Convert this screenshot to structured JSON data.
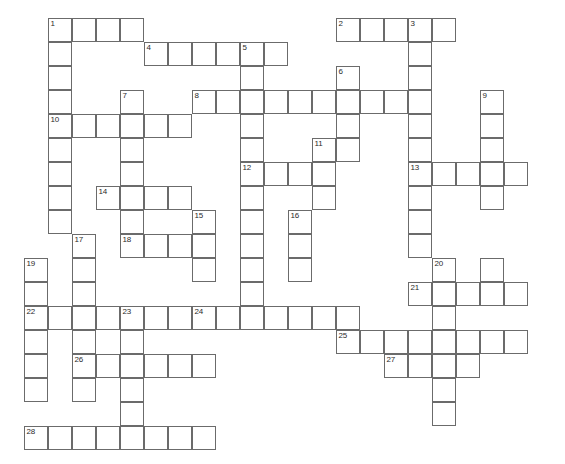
{
  "puzzle": {
    "title": "Crossword Grid",
    "geometry": {
      "origin_x": 24,
      "origin_y": 18,
      "cell_size": 24,
      "columns": 22,
      "rows": 18,
      "border_color": "#6b6b6b",
      "cell_fill": "#ffffff",
      "number_color": "#2b2b2b",
      "background": "#ffffff"
    },
    "entries": [
      {
        "number": 1,
        "direction": "across",
        "col": 1,
        "row": 0,
        "length": 4
      },
      {
        "number": 1,
        "direction": "down",
        "col": 1,
        "row": 0,
        "length": 9
      },
      {
        "number": 2,
        "direction": "across",
        "col": 13,
        "row": 0,
        "length": 5
      },
      {
        "number": 3,
        "direction": "down",
        "col": 16,
        "row": 0,
        "length": 9
      },
      {
        "number": 4,
        "direction": "across",
        "col": 5,
        "row": 1,
        "length": 6
      },
      {
        "number": 5,
        "direction": "down",
        "col": 9,
        "row": 1,
        "length": 9
      },
      {
        "number": 6,
        "direction": "down",
        "col": 13,
        "row": 2,
        "length": 4
      },
      {
        "number": 7,
        "direction": "down",
        "col": 4,
        "row": 3,
        "length": 7
      },
      {
        "number": 8,
        "direction": "across",
        "col": 7,
        "row": 3,
        "length": 10
      },
      {
        "number": 9,
        "direction": "down",
        "col": 19,
        "row": 3,
        "length": 5
      },
      {
        "number": 10,
        "direction": "across",
        "col": 1,
        "row": 4,
        "length": 6
      },
      {
        "number": 11,
        "direction": "down",
        "col": 12,
        "row": 5,
        "length": 3
      },
      {
        "number": 12,
        "direction": "across",
        "col": 9,
        "row": 6,
        "length": 4
      },
      {
        "number": 13,
        "direction": "across",
        "col": 16,
        "row": 6,
        "length": 5
      },
      {
        "number": 14,
        "direction": "across",
        "col": 3,
        "row": 7,
        "length": 4
      },
      {
        "number": 15,
        "direction": "down",
        "col": 7,
        "row": 8,
        "length": 3
      },
      {
        "number": 16,
        "direction": "down",
        "col": 11,
        "row": 8,
        "length": 3
      },
      {
        "number": 17,
        "direction": "down",
        "col": 2,
        "row": 9,
        "length": 9
      },
      {
        "number": 18,
        "direction": "across",
        "col": 4,
        "row": 9,
        "length": 3
      },
      {
        "number": 19,
        "direction": "down",
        "col": 0,
        "row": 10,
        "length": 8
      },
      {
        "number": 20,
        "direction": "down",
        "col": 17,
        "row": 10,
        "length": 3
      },
      {
        "number": 21,
        "direction": "across",
        "col": 16,
        "row": 11,
        "length": 5
      },
      {
        "number": 22,
        "direction": "across",
        "col": 0,
        "row": 12,
        "length": 7
      },
      {
        "number": 23,
        "direction": "down",
        "col": 4,
        "row": 12,
        "length": 7
      },
      {
        "number": 24,
        "direction": "across",
        "col": 7,
        "row": 12,
        "length": 7
      },
      {
        "number": 25,
        "direction": "across",
        "col": 13,
        "row": 13,
        "length": 8
      },
      {
        "number": 26,
        "direction": "across",
        "col": 2,
        "row": 14,
        "length": 6
      },
      {
        "number": 27,
        "direction": "across",
        "col": 15,
        "row": 14,
        "length": 4
      },
      {
        "number": 28,
        "direction": "across",
        "col": 0,
        "row": 17,
        "length": 8
      }
    ],
    "cells": [
      {
        "col": 1,
        "row": 0,
        "number": 1
      },
      {
        "col": 2,
        "row": 0
      },
      {
        "col": 3,
        "row": 0
      },
      {
        "col": 4,
        "row": 0
      },
      {
        "col": 13,
        "row": 0,
        "number": 2
      },
      {
        "col": 14,
        "row": 0
      },
      {
        "col": 15,
        "row": 0
      },
      {
        "col": 16,
        "row": 0,
        "number": 3
      },
      {
        "col": 17,
        "row": 0
      },
      {
        "col": 1,
        "row": 1
      },
      {
        "col": 5,
        "row": 1,
        "number": 4
      },
      {
        "col": 6,
        "row": 1
      },
      {
        "col": 7,
        "row": 1
      },
      {
        "col": 8,
        "row": 1
      },
      {
        "col": 9,
        "row": 1,
        "number": 5
      },
      {
        "col": 10,
        "row": 1
      },
      {
        "col": 16,
        "row": 1
      },
      {
        "col": 1,
        "row": 2
      },
      {
        "col": 9,
        "row": 2
      },
      {
        "col": 13,
        "row": 2,
        "number": 6
      },
      {
        "col": 16,
        "row": 2
      },
      {
        "col": 1,
        "row": 3
      },
      {
        "col": 4,
        "row": 3,
        "number": 7
      },
      {
        "col": 7,
        "row": 3,
        "number": 8
      },
      {
        "col": 8,
        "row": 3
      },
      {
        "col": 9,
        "row": 3
      },
      {
        "col": 10,
        "row": 3
      },
      {
        "col": 11,
        "row": 3
      },
      {
        "col": 12,
        "row": 3
      },
      {
        "col": 13,
        "row": 3
      },
      {
        "col": 14,
        "row": 3
      },
      {
        "col": 15,
        "row": 3
      },
      {
        "col": 16,
        "row": 3
      },
      {
        "col": 19,
        "row": 3,
        "number": 9
      },
      {
        "col": 1,
        "row": 4,
        "number": 10
      },
      {
        "col": 2,
        "row": 4
      },
      {
        "col": 3,
        "row": 4
      },
      {
        "col": 4,
        "row": 4
      },
      {
        "col": 5,
        "row": 4
      },
      {
        "col": 6,
        "row": 4
      },
      {
        "col": 9,
        "row": 4
      },
      {
        "col": 13,
        "row": 4
      },
      {
        "col": 16,
        "row": 4
      },
      {
        "col": 19,
        "row": 4
      },
      {
        "col": 1,
        "row": 5
      },
      {
        "col": 4,
        "row": 5
      },
      {
        "col": 9,
        "row": 5
      },
      {
        "col": 12,
        "row": 5,
        "number": 11
      },
      {
        "col": 13,
        "row": 5
      },
      {
        "col": 16,
        "row": 5
      },
      {
        "col": 19,
        "row": 5
      },
      {
        "col": 1,
        "row": 6
      },
      {
        "col": 4,
        "row": 6
      },
      {
        "col": 9,
        "row": 6,
        "number": 12
      },
      {
        "col": 10,
        "row": 6
      },
      {
        "col": 11,
        "row": 6
      },
      {
        "col": 12,
        "row": 6
      },
      {
        "col": 16,
        "row": 6,
        "number": 13
      },
      {
        "col": 17,
        "row": 6
      },
      {
        "col": 18,
        "row": 6
      },
      {
        "col": 19,
        "row": 6
      },
      {
        "col": 20,
        "row": 6
      },
      {
        "col": 1,
        "row": 7
      },
      {
        "col": 3,
        "row": 7,
        "number": 14
      },
      {
        "col": 4,
        "row": 7
      },
      {
        "col": 5,
        "row": 7
      },
      {
        "col": 6,
        "row": 7
      },
      {
        "col": 9,
        "row": 7
      },
      {
        "col": 12,
        "row": 7
      },
      {
        "col": 16,
        "row": 7
      },
      {
        "col": 19,
        "row": 7
      },
      {
        "col": 1,
        "row": 8
      },
      {
        "col": 4,
        "row": 8
      },
      {
        "col": 7,
        "row": 8,
        "number": 15
      },
      {
        "col": 9,
        "row": 8
      },
      {
        "col": 11,
        "row": 8,
        "number": 16
      },
      {
        "col": 16,
        "row": 8
      },
      {
        "col": 2,
        "row": 9,
        "number": 17
      },
      {
        "col": 4,
        "row": 9,
        "number": 18
      },
      {
        "col": 5,
        "row": 9
      },
      {
        "col": 6,
        "row": 9
      },
      {
        "col": 7,
        "row": 9
      },
      {
        "col": 9,
        "row": 9
      },
      {
        "col": 11,
        "row": 9
      },
      {
        "col": 16,
        "row": 9
      },
      {
        "col": 0,
        "row": 10,
        "number": 19
      },
      {
        "col": 2,
        "row": 10
      },
      {
        "col": 7,
        "row": 10
      },
      {
        "col": 9,
        "row": 10
      },
      {
        "col": 11,
        "row": 10
      },
      {
        "col": 17,
        "row": 10,
        "number": 20
      },
      {
        "col": 19,
        "row": 10
      },
      {
        "col": 0,
        "row": 11
      },
      {
        "col": 2,
        "row": 11
      },
      {
        "col": 9,
        "row": 11
      },
      {
        "col": 16,
        "row": 11,
        "number": 21
      },
      {
        "col": 17,
        "row": 11
      },
      {
        "col": 18,
        "row": 11
      },
      {
        "col": 19,
        "row": 11
      },
      {
        "col": 20,
        "row": 11
      },
      {
        "col": 0,
        "row": 12,
        "number": 22
      },
      {
        "col": 1,
        "row": 12
      },
      {
        "col": 2,
        "row": 12
      },
      {
        "col": 3,
        "row": 12
      },
      {
        "col": 4,
        "row": 12,
        "number": 23
      },
      {
        "col": 5,
        "row": 12
      },
      {
        "col": 6,
        "row": 12
      },
      {
        "col": 7,
        "row": 12,
        "number": 24
      },
      {
        "col": 8,
        "row": 12
      },
      {
        "col": 9,
        "row": 12
      },
      {
        "col": 10,
        "row": 12
      },
      {
        "col": 11,
        "row": 12
      },
      {
        "col": 12,
        "row": 12
      },
      {
        "col": 13,
        "row": 12
      },
      {
        "col": 17,
        "row": 12
      },
      {
        "col": 0,
        "row": 13
      },
      {
        "col": 2,
        "row": 13
      },
      {
        "col": 4,
        "row": 13
      },
      {
        "col": 13,
        "row": 13,
        "number": 25
      },
      {
        "col": 14,
        "row": 13
      },
      {
        "col": 15,
        "row": 13
      },
      {
        "col": 16,
        "row": 13
      },
      {
        "col": 17,
        "row": 13
      },
      {
        "col": 18,
        "row": 13
      },
      {
        "col": 19,
        "row": 13
      },
      {
        "col": 20,
        "row": 13
      },
      {
        "col": 0,
        "row": 14
      },
      {
        "col": 2,
        "row": 14,
        "number": 26
      },
      {
        "col": 3,
        "row": 14
      },
      {
        "col": 4,
        "row": 14
      },
      {
        "col": 5,
        "row": 14
      },
      {
        "col": 6,
        "row": 14
      },
      {
        "col": 7,
        "row": 14
      },
      {
        "col": 15,
        "row": 14,
        "number": 27
      },
      {
        "col": 16,
        "row": 14
      },
      {
        "col": 17,
        "row": 14
      },
      {
        "col": 18,
        "row": 14
      },
      {
        "col": 0,
        "row": 15
      },
      {
        "col": 2,
        "row": 15
      },
      {
        "col": 4,
        "row": 15
      },
      {
        "col": 17,
        "row": 15
      },
      {
        "col": 4,
        "row": 16
      },
      {
        "col": 17,
        "row": 16
      },
      {
        "col": 0,
        "row": 17,
        "number": 28
      },
      {
        "col": 1,
        "row": 17
      },
      {
        "col": 2,
        "row": 17
      },
      {
        "col": 3,
        "row": 17
      },
      {
        "col": 4,
        "row": 17
      },
      {
        "col": 5,
        "row": 17
      },
      {
        "col": 6,
        "row": 17
      },
      {
        "col": 7,
        "row": 17
      }
    ]
  }
}
